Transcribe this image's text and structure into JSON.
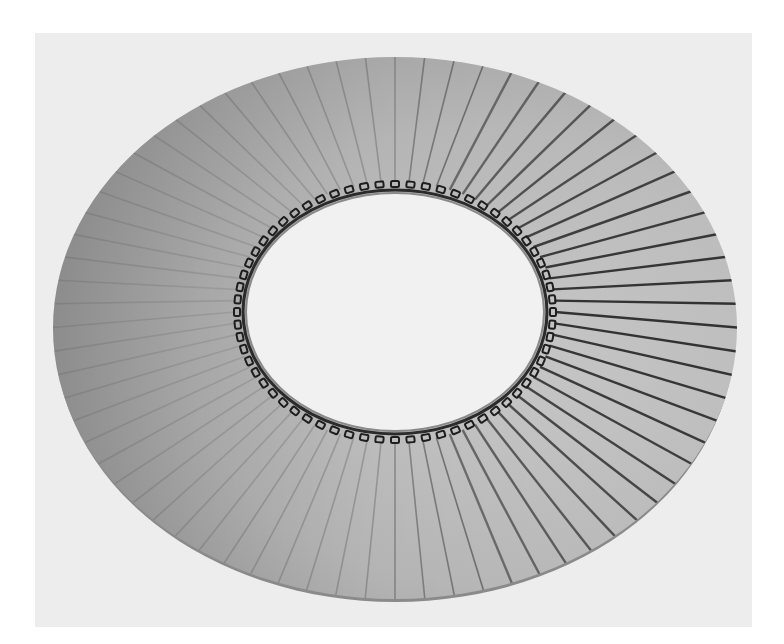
{
  "image": {
    "subject": "Pleated fabric buffing wheel (photograph, grayscale)",
    "alt": "Photograph of a pleated cloth buffing wheel with stitched center hole",
    "colors": {
      "page_background": "#ffffff",
      "photo_background": "#ededed",
      "fabric_light": "#c9c9c9",
      "fabric_mid": "#b4b4b4",
      "fabric_dark": "#9a9a9a",
      "pleat_line": "#2a2a2a",
      "stitch": "#1e1e1e",
      "hole": "#f1f1f1"
    },
    "geometry": {
      "outer": {
        "cx": 395,
        "cy": 328,
        "rx": 342,
        "ry": 271
      },
      "inner": {
        "cx": 395,
        "cy": 312,
        "rx": 150,
        "ry": 120
      },
      "pleat_count": 72
    }
  }
}
